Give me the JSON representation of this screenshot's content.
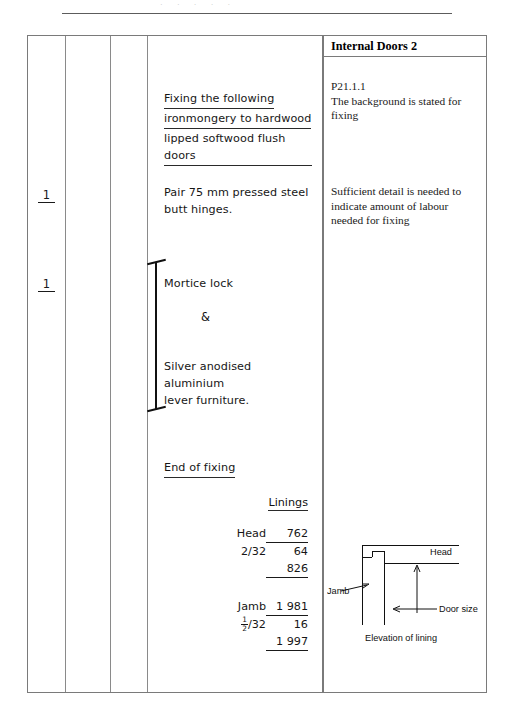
{
  "page": {
    "ghost_text": "· ·  · ·   ·"
  },
  "dimension_sheet": {
    "columns": [
      "timesing",
      "dimensions",
      "squaring",
      "description"
    ],
    "timesing_entries": [
      {
        "value": "1",
        "for": "Pair 75 mm pressed steel butt hinges."
      },
      {
        "value": "1",
        "for": "Mortice lock & Silver anodised aluminium lever furniture."
      }
    ],
    "description_items": [
      {
        "id": "heading-fixing",
        "underlined": true,
        "lines": [
          "Fixing the following",
          "ironmongery to hardwood",
          "lipped softwood flush doors"
        ]
      },
      {
        "id": "item-hinges",
        "underlined": false,
        "lines": [
          "Pair 75 mm pressed steel",
          "butt hinges."
        ]
      },
      {
        "id": "item-mortice-lock",
        "underlined": false,
        "lines": [
          "Mortice lock"
        ]
      },
      {
        "id": "ampersand",
        "text": "&"
      },
      {
        "id": "item-lever-furniture",
        "underlined": false,
        "lines": [
          "Silver anodised aluminium",
          "lever furniture."
        ]
      },
      {
        "id": "end-of-fixing",
        "underlined": true,
        "lines": [
          "End of fixing"
        ]
      }
    ],
    "build_up": {
      "title": "Linings",
      "groups": [
        {
          "id": "head",
          "rows": [
            {
              "label": "Head",
              "value": "762",
              "rule": "none"
            },
            {
              "label": "2/32",
              "value": "64",
              "rule": "above"
            },
            {
              "label": "",
              "value": "826",
              "rule": "total"
            }
          ]
        },
        {
          "id": "jamb",
          "rows": [
            {
              "label": "Jamb",
              "value": "1 981",
              "rule": "none"
            },
            {
              "label": "½/32",
              "label_fraction": {
                "numerator": "1",
                "denominator": "2",
                "suffix": "/32"
              },
              "value": "16",
              "rule": "above"
            },
            {
              "label": "",
              "value": "1 997",
              "rule": "total"
            }
          ]
        }
      ]
    }
  },
  "commentary": {
    "title": "Internal Doors 2",
    "notes": [
      {
        "id": "note-p21",
        "lines": [
          "P21.1.1",
          "The background is stated for",
          "fixing"
        ]
      },
      {
        "id": "note-detail",
        "lines": [
          "Sufficient detail is needed to",
          "indicate amount of labour",
          "needed for fixing"
        ]
      }
    ],
    "diagram": {
      "caption": "Elevation of lining",
      "labels": {
        "head": "Head",
        "jamb": "Jamb",
        "door_size": "Door size"
      }
    }
  }
}
